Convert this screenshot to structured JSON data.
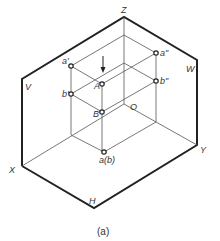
{
  "diagram": {
    "type": "three-plane projection (isometric)",
    "caption": "(a)",
    "planes": {
      "V": "V",
      "H": "H",
      "W": "W"
    },
    "axes": {
      "X": "X",
      "Y": "Y",
      "Z": "Z",
      "O": "O"
    },
    "points": {
      "A": "A",
      "B": "B",
      "a_prime": "a'",
      "b_prime": "b'",
      "a_dprime": "a\"",
      "b_dprime": "b\"",
      "ab_horizontal": "a(b)"
    },
    "colors": {
      "heavy_line": "#222222",
      "thin_line": "#555555",
      "text": "#333333"
    }
  }
}
